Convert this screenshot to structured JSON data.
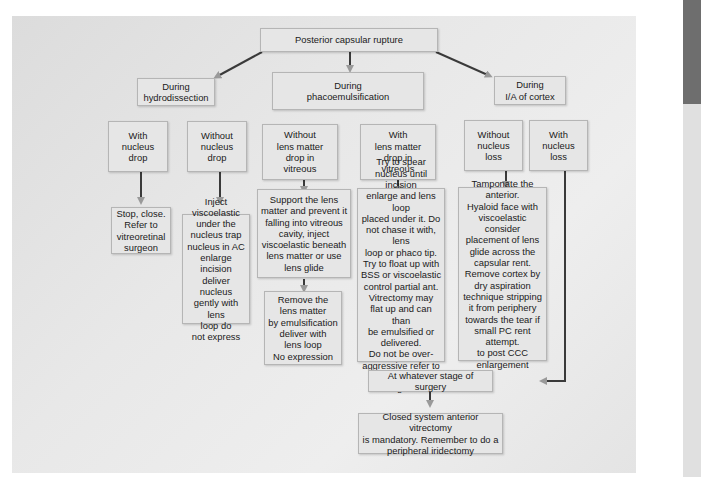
{
  "diagram": {
    "root": "Posterior capsular rupture",
    "stages": {
      "hydrodissection": "During\nhydrodissection",
      "phaco": "During\nphacoemulsification",
      "ia": "During\nI/A of cortex"
    },
    "conditions": {
      "with_nucleus_drop": "With\nnucleus\ndrop",
      "without_nucleus_drop": "Without\nnucleus\ndrop",
      "without_lens_matter_drop": "Without\nlens matter\ndrop in\nvitreous",
      "with_lens_matter_drop": "With\nlens matter\ndrop in\nvitreous",
      "without_nucleus_loss": "Without\nnucleus\nloss",
      "with_nucleus_loss": "With\nnucleus\nloss"
    },
    "actions": {
      "stop_close": "Stop, close.\nRefer to\nvitreoretinal\nsurgeon",
      "inject_viscoelastic": "Inject\nviscoelastic\nunder the\nnucleus trap\nnucleus in AC\nenlarge incision\ndeliver nucleus\ngently with lens\nloop do\nnot express",
      "support_lens_matter": "Support the lens\nmatter and prevent it\nfalling into vitreous\ncavity, inject\nviscoelastic beneath\nlens matter or use\nlens glide",
      "remove_lens_matter": "Remove the\nlens matter\nby emulsification\ndeliver with\nlens loop\nNo expression",
      "spear_nucleus": "Try to spear\nnucleus until incision\nenlarge and lens loop\nplaced under it. Do\nnot chase it with, lens\nloop or phaco tip.\nTry to float up with\nBSS or viscoelastic\ncontrol partial ant.\nVitrectomy may\nflat up and can than\nbe emulsified or\ndelivered.\nDo not be over-\naggressive refer to\nvitreoretinal surgeon",
      "tamponate": "Tamponate the\nanterior.\nHyaloid face with\nviscoelastic consider\nplacement of lens\nglide across the\ncapsular rent.\nRemove cortex by\ndry aspiration\ntechnique stripping\nit from periphery\ntowards the tear if\nsmall PC rent attempt.\nto post CCC\nenlargement"
    },
    "merge": "At whatever stage of surgery",
    "final": "Closed system anterior vitrectomy\nis mandatory. Remember to do a\nperipheral iridectomy"
  },
  "colors": {
    "panel_bg": "#e8e8e8",
    "box_bg": "#e6e6e6",
    "arrow": "#3a3a3a",
    "arrow_head": "#9a9a9a"
  }
}
